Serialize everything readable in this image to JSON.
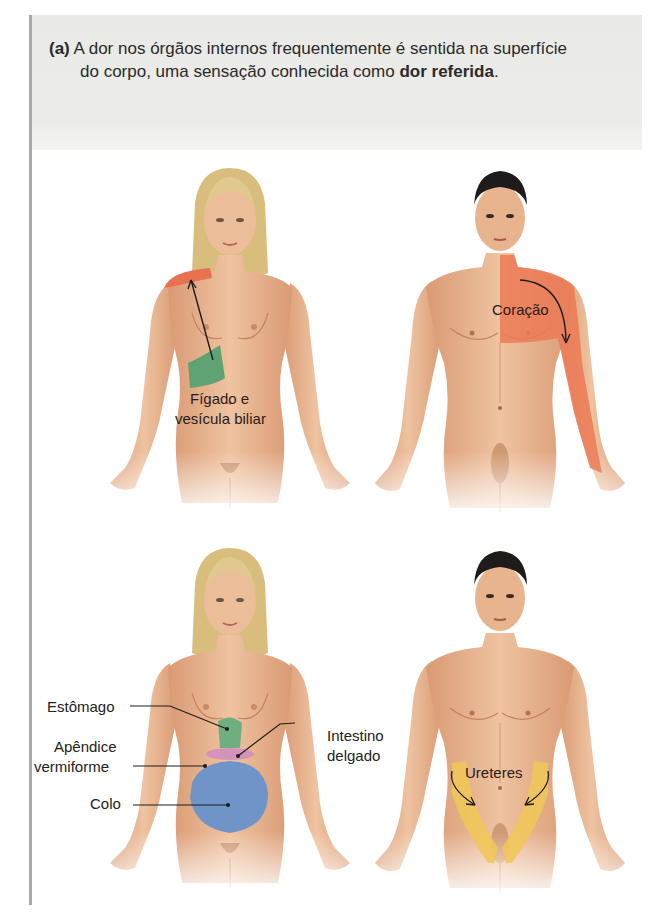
{
  "caption": {
    "tag": "(a)",
    "line1": "A dor nos órgãos internos frequentemente é sentida na superfície",
    "line2_prefix": "do corpo, uma sensação conhecida como ",
    "line2_bold": "dor referida",
    "line2_suffix": "."
  },
  "figures": [
    {
      "id": "female-top",
      "subject": "female",
      "labels": [
        {
          "text_line1": "Fígado e",
          "text_line2": "vesícula biliar"
        }
      ],
      "regions": [
        {
          "name": "liver-gallbladder-organ",
          "color": "#5fa374"
        },
        {
          "name": "referred-shoulder",
          "color": "#e8714f"
        }
      ]
    },
    {
      "id": "male-top",
      "subject": "male",
      "labels": [
        {
          "text": "Coração"
        }
      ],
      "regions": [
        {
          "name": "referred-chest-arm",
          "color": "#ec7a56"
        }
      ]
    },
    {
      "id": "female-bottom",
      "subject": "female",
      "labels": [
        {
          "text": "Estômago"
        },
        {
          "text_line1": "Apêndice",
          "text_line2": "vermiforme"
        },
        {
          "text": "Colo"
        },
        {
          "text_line1": "Intestino",
          "text_line2": "delgado"
        }
      ],
      "regions": [
        {
          "name": "stomach",
          "color": "#6fae7f"
        },
        {
          "name": "small-intestine",
          "color": "#d493b8"
        },
        {
          "name": "appendix",
          "color": "#d8c66a"
        },
        {
          "name": "colon",
          "color": "#6e94c8"
        }
      ]
    },
    {
      "id": "male-bottom",
      "subject": "male",
      "labels": [
        {
          "text": "Ureteres"
        }
      ],
      "regions": [
        {
          "name": "ureters",
          "color": "#efc65a"
        }
      ]
    }
  ],
  "colors": {
    "skin": "#e7b48f",
    "skin_shadow": "#c98d66",
    "female_hair": "#dcc384",
    "male_hair": "#1e1b1a",
    "header_band": "#e9e9e6",
    "rule": "#a9a9a6"
  }
}
